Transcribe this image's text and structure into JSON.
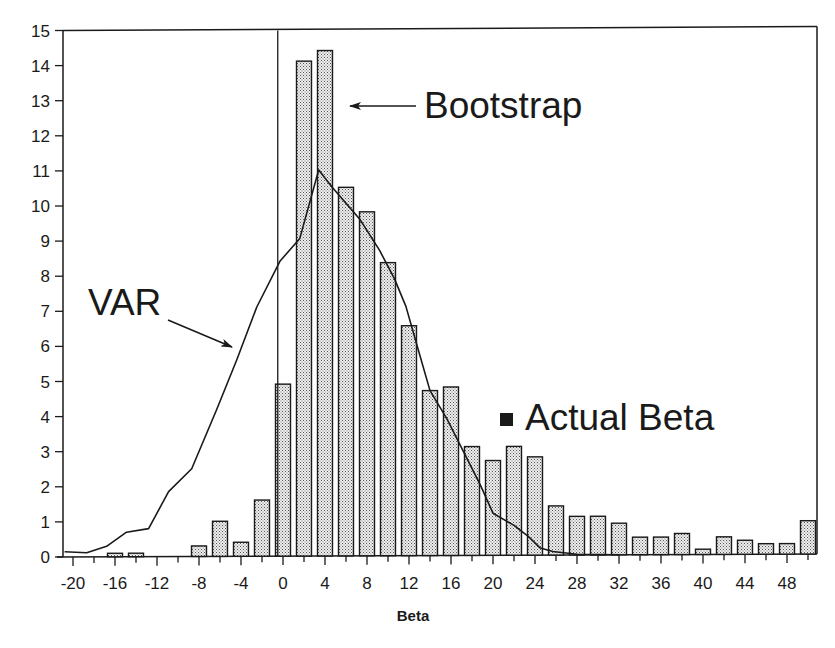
{
  "chart_data": {
    "type": "bar",
    "title": "",
    "xlabel": "Beta",
    "ylabel": "",
    "xlim": [
      -21,
      51
    ],
    "ylim": [
      0,
      15
    ],
    "grid": false,
    "x_ticks": [
      -20,
      -18,
      -16,
      -14,
      -12,
      -10,
      -8,
      -6,
      -4,
      -2,
      0,
      2,
      4,
      6,
      8,
      10,
      12,
      14,
      16,
      18,
      20,
      22,
      24,
      26,
      28,
      30,
      32,
      34,
      36,
      38,
      40,
      42,
      44,
      46,
      48,
      50
    ],
    "x_tick_labels": [
      "-20",
      "-16",
      "-12",
      "-8",
      "-4",
      "0",
      "4",
      "8",
      "12",
      "16",
      "20",
      "24",
      "28",
      "32",
      "36",
      "40",
      "44",
      "48"
    ],
    "x_tick_label_values": [
      -20,
      -16,
      -12,
      -8,
      -4,
      0,
      4,
      8,
      12,
      16,
      20,
      24,
      28,
      32,
      36,
      40,
      44,
      48
    ],
    "y_ticks": [
      0,
      1,
      2,
      3,
      4,
      5,
      6,
      7,
      8,
      9,
      10,
      11,
      12,
      13,
      14,
      15
    ],
    "y_tick_labels": [
      "0",
      "1",
      "2",
      "3",
      "4",
      "5",
      "6",
      "7",
      "8",
      "9",
      "10",
      "11",
      "12",
      "13",
      "14",
      "15"
    ],
    "series": [
      {
        "name": "Bootstrap",
        "type": "bar",
        "x": [
          -16,
          -14,
          -8,
          -6,
          -4,
          -2,
          0,
          2,
          4,
          6,
          8,
          10,
          12,
          14,
          16,
          18,
          20,
          22,
          24,
          26,
          28,
          30,
          32,
          34,
          36,
          38,
          40,
          42,
          44,
          46,
          48,
          50
        ],
        "values": [
          0.1,
          0.1,
          0.3,
          1.0,
          0.4,
          1.6,
          4.9,
          14.1,
          14.4,
          10.5,
          9.8,
          8.35,
          6.55,
          4.7,
          4.8,
          3.1,
          2.7,
          3.1,
          2.8,
          1.4,
          1.1,
          1.1,
          0.9,
          0.5,
          0.5,
          0.6,
          0.15,
          0.5,
          0.4,
          0.3,
          0.3,
          0.95
        ]
      },
      {
        "name": "VAR",
        "type": "line",
        "x": [
          -20.8,
          -18.7,
          -16.8,
          -14.9,
          -12.8,
          -10.9,
          -8.7,
          -6.3,
          -4.4,
          -2.5,
          -0.3,
          1.6,
          3.4,
          4.7,
          7.3,
          9.2,
          10.6,
          11.7,
          12.8,
          14.0,
          15.6,
          17.2,
          18.8,
          20.0,
          22.0,
          23.3,
          24.5,
          25.7,
          28.0,
          32.0
        ],
        "values": [
          0.15,
          0.12,
          0.3,
          0.7,
          0.8,
          1.85,
          2.5,
          4.2,
          5.6,
          7.1,
          8.4,
          9.05,
          11.0,
          10.5,
          9.6,
          8.7,
          7.9,
          7.1,
          5.95,
          4.7,
          3.9,
          2.95,
          2.0,
          1.2,
          0.85,
          0.55,
          0.2,
          0.1,
          0.02,
          0.0
        ]
      }
    ],
    "reference_line": {
      "x": -0.5,
      "orientation": "vertical"
    },
    "annotations": [
      {
        "text": "Bootstrap",
        "arrow": true
      },
      {
        "text": "VAR",
        "arrow": true
      },
      {
        "text": "Actual Beta",
        "marker": "filled-square",
        "x": 21.5,
        "y": 4.0
      }
    ],
    "legend": "inline annotations"
  },
  "labels": {
    "xlabel": "Beta",
    "bootstrap": "Bootstrap",
    "var": "VAR",
    "actual_beta": "Actual Beta"
  },
  "colors": {
    "bar_fill": "#d8d8d8",
    "bar_stroke": "#1a1a1a",
    "line": "#1a1a1a",
    "axis": "#1a1a1a"
  }
}
